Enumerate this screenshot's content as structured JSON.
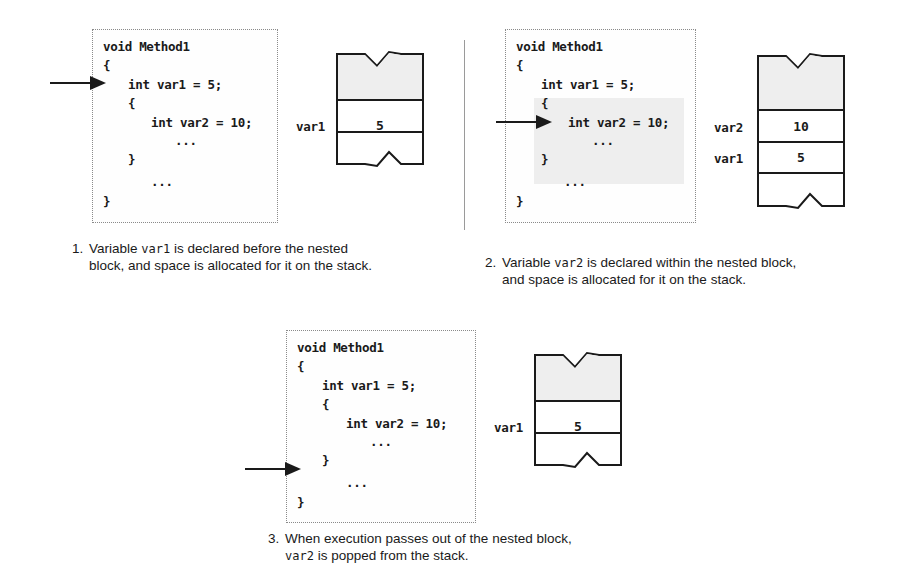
{
  "panels": [
    {
      "id": 1,
      "code_lines": [
        "void Method1",
        "{",
        "int var1 = 5;",
        "{",
        "int var2 = 10;",
        "...",
        "}",
        "...",
        "}"
      ],
      "arrow_at_line": 2,
      "stack": {
        "slots": [
          {
            "label": "var1",
            "value": "5"
          }
        ]
      },
      "caption": {
        "number": "1.",
        "line1_pre": "Variable ",
        "line1_code": "var1",
        "line1_post": " is declared before the nested",
        "line2": "block, and space is allocated for it on the stack."
      }
    },
    {
      "id": 2,
      "code_lines": [
        "void Method1",
        "{",
        "int var1 = 5;",
        "{",
        "int var2 = 10;",
        "...",
        "}",
        "...",
        "}"
      ],
      "arrow_at_line": 4,
      "highlight": "nested block shaded",
      "stack": {
        "slots": [
          {
            "label": "var2",
            "value": "10"
          },
          {
            "label": "var1",
            "value": "5"
          }
        ]
      },
      "caption": {
        "number": "2.",
        "line1_pre": "Variable ",
        "line1_code": "var2",
        "line1_post": " is declared within the nested block,",
        "line2": "and space is allocated for it on the stack."
      }
    },
    {
      "id": 3,
      "code_lines": [
        "void Method1",
        "{",
        "int var1 = 5;",
        "{",
        "int var2 = 10;",
        "...",
        "}",
        "...",
        "}"
      ],
      "arrow_at_line": 6,
      "stack": {
        "slots": [
          {
            "label": "var1",
            "value": "5"
          }
        ]
      },
      "caption": {
        "number": "3.",
        "line1": "When execution passes out of the nested block,",
        "line2_code": "var2",
        "line2_post": " is popped from the stack."
      }
    }
  ],
  "colors": {
    "stroke": "#1a1a1a",
    "stack_fill": "#eeeeee",
    "box_border": "#8a8a8a"
  }
}
